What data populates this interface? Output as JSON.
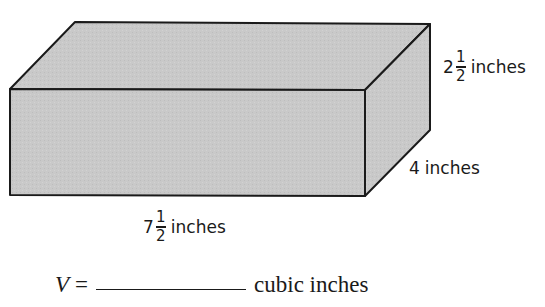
{
  "figure": {
    "shape": "rectangular-prism",
    "fill_color": "#c9c9c9",
    "edge_color": "#1a1a1a",
    "height_label": {
      "whole": "2",
      "numerator": "1",
      "denominator": "2",
      "unit": "inches"
    },
    "width_label": {
      "whole": "",
      "value": "4",
      "unit": "inches"
    },
    "length_label": {
      "whole": "7",
      "numerator": "1",
      "denominator": "2",
      "unit": "inches"
    }
  },
  "equation": {
    "variable": "V",
    "equals": "=",
    "answer": "",
    "unit": "cubic inches"
  }
}
